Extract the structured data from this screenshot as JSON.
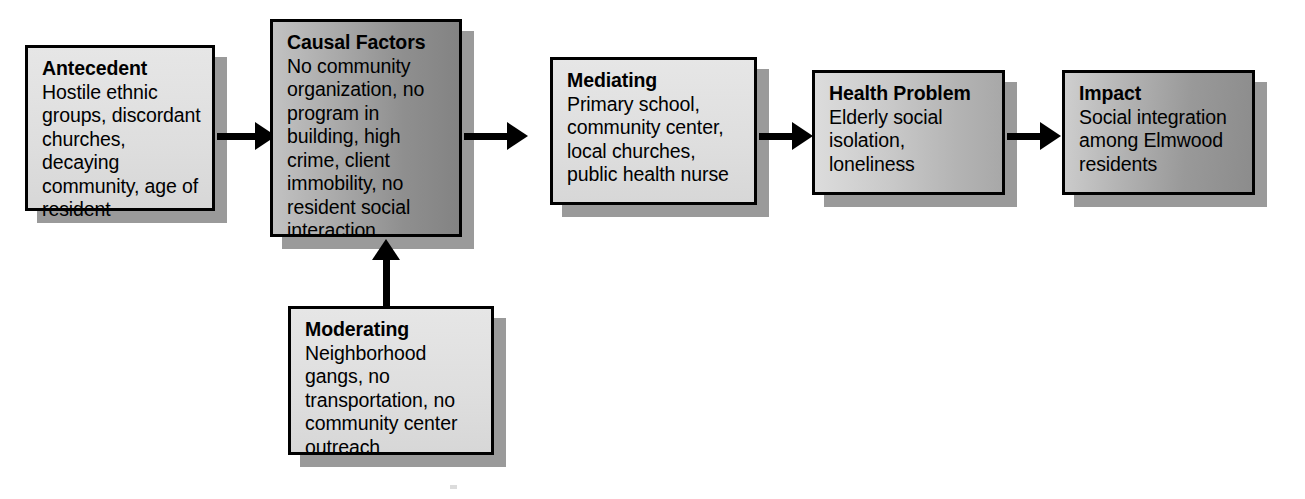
{
  "diagram": {
    "type": "flow-diagram",
    "nodes": [
      {
        "id": "antecedent",
        "title": "Antecedent",
        "body": "Hostile ethnic groups, discordant churches, decaying community, age of resident",
        "fill": "light"
      },
      {
        "id": "causal-factors",
        "title": "Causal Factors",
        "body": "No community organization, no program in building, high crime, client immobility, no resident social interaction",
        "fill": "dark"
      },
      {
        "id": "mediating",
        "title": "Mediating",
        "body": "Primary school, community center, local churches, public health nurse",
        "fill": "light"
      },
      {
        "id": "health-problem",
        "title": "Health Problem",
        "body": "Elderly social isolation, loneliness",
        "fill": "mid"
      },
      {
        "id": "impact",
        "title": "Impact",
        "body": "Social integration among Elmwood residents",
        "fill": "darkest"
      },
      {
        "id": "moderating",
        "title": "Moderating",
        "body": "Neighborhood gangs, no transportation, no community center outreach",
        "fill": "light"
      }
    ],
    "edges": [
      {
        "id": "antecedent-to-causal",
        "from": "antecedent",
        "to": "causal-factors",
        "direction": "right"
      },
      {
        "id": "causal-to-mediating",
        "from": "causal-factors",
        "to": "mediating",
        "direction": "right"
      },
      {
        "id": "mediating-to-health",
        "from": "mediating",
        "to": "health-problem",
        "direction": "right"
      },
      {
        "id": "health-to-impact",
        "from": "health-problem",
        "to": "impact",
        "direction": "right"
      },
      {
        "id": "moderating-to-causal",
        "from": "moderating",
        "to": "causal-factors",
        "direction": "up"
      }
    ],
    "colors": {
      "border": "#000000",
      "text": "#000000",
      "shadow": "#9a9a9a",
      "background": "#ffffff",
      "arrow": "#000000"
    }
  }
}
